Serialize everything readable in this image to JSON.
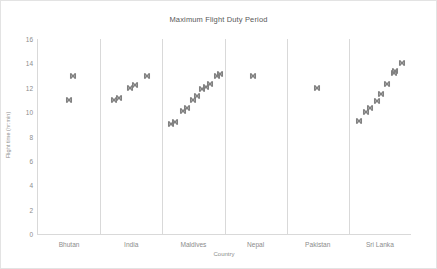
{
  "chart_data": {
    "type": "scatter",
    "title": "Maximum Flight Duty Period",
    "xlabel": "Country",
    "ylabel": "Flight time (hr:min)",
    "categories": [
      "Bhutan",
      "India",
      "Maldives",
      "Nepal",
      "Pakistan",
      "Sri Lanka"
    ],
    "ylim": [
      0,
      16
    ],
    "yticks": [
      0,
      2,
      4,
      6,
      8,
      10,
      12,
      14,
      16
    ],
    "grid": false,
    "legend": "none",
    "marker": {
      "shape": "cross-x",
      "color": "#808080",
      "size": 7
    },
    "series": [
      {
        "name": "Bhutan",
        "category_index": 0,
        "points": [
          {
            "offset": 0.5,
            "value": 11.0
          },
          {
            "offset": 0.56,
            "value": 13.0
          }
        ]
      },
      {
        "name": "India",
        "category_index": 1,
        "points": [
          {
            "offset": 0.22,
            "value": 11.0
          },
          {
            "offset": 0.3,
            "value": 11.2
          },
          {
            "offset": 0.48,
            "value": 12.0
          },
          {
            "offset": 0.56,
            "value": 12.2
          },
          {
            "offset": 0.76,
            "value": 13.0
          }
        ]
      },
      {
        "name": "Maldives",
        "category_index": 2,
        "points": [
          {
            "offset": 0.14,
            "value": 9.0
          },
          {
            "offset": 0.2,
            "value": 9.2
          },
          {
            "offset": 0.33,
            "value": 10.1
          },
          {
            "offset": 0.39,
            "value": 10.3
          },
          {
            "offset": 0.5,
            "value": 11.0
          },
          {
            "offset": 0.56,
            "value": 11.3
          },
          {
            "offset": 0.64,
            "value": 11.9
          },
          {
            "offset": 0.7,
            "value": 12.1
          },
          {
            "offset": 0.76,
            "value": 12.3
          },
          {
            "offset": 0.88,
            "value": 13.0
          },
          {
            "offset": 0.93,
            "value": 13.1
          }
        ]
      },
      {
        "name": "Nepal",
        "category_index": 3,
        "points": [
          {
            "offset": 0.46,
            "value": 13.0
          }
        ]
      },
      {
        "name": "Pakistan",
        "category_index": 4,
        "points": [
          {
            "offset": 0.48,
            "value": 12.0
          }
        ]
      },
      {
        "name": "Sri Lanka",
        "category_index": 5,
        "points": [
          {
            "offset": 0.16,
            "value": 9.3
          },
          {
            "offset": 0.28,
            "value": 10.0
          },
          {
            "offset": 0.34,
            "value": 10.3
          },
          {
            "offset": 0.45,
            "value": 10.9
          },
          {
            "offset": 0.52,
            "value": 11.5
          },
          {
            "offset": 0.62,
            "value": 12.3
          },
          {
            "offset": 0.72,
            "value": 13.2
          },
          {
            "offset": 0.75,
            "value": 13.4
          },
          {
            "offset": 0.86,
            "value": 14.0
          }
        ]
      }
    ]
  }
}
